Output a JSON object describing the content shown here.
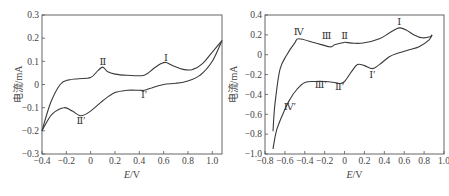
{
  "chart_data": [
    {
      "type": "line",
      "title": "",
      "xlabel": "E/V",
      "ylabel": "电流/mA",
      "xlim": [
        -0.4,
        1.08
      ],
      "ylim": [
        -0.3,
        0.3
      ],
      "xticks": [
        "-0.4",
        "-0.2",
        "0",
        "0.2",
        "0.4",
        "0.6",
        "0.8",
        "1.0"
      ],
      "yticks": [
        "0.3",
        "0.2",
        "0.1",
        "0",
        "-0.1",
        "-0.2",
        "-0.3"
      ],
      "grid": false,
      "legend": null,
      "series": [
        {
          "name": "anodic scan",
          "x": [
            -0.4,
            -0.33,
            -0.25,
            -0.18,
            -0.1,
            0.0,
            0.06,
            0.1,
            0.14,
            0.2,
            0.3,
            0.44,
            0.52,
            0.58,
            0.62,
            0.68,
            0.76,
            0.84,
            0.92,
            1.0,
            1.08
          ],
          "y": [
            -0.2,
            -0.08,
            0.0,
            0.02,
            0.025,
            0.03,
            0.06,
            0.075,
            0.055,
            0.045,
            0.04,
            0.04,
            0.07,
            0.09,
            0.095,
            0.08,
            0.065,
            0.065,
            0.09,
            0.14,
            0.19
          ]
        },
        {
          "name": "cathodic scan",
          "x": [
            -0.4,
            -0.32,
            -0.22,
            -0.15,
            -0.08,
            0.0,
            0.1,
            0.2,
            0.3,
            0.4,
            0.44,
            0.5,
            0.6,
            0.7,
            0.8,
            0.9,
            1.0,
            1.08
          ],
          "y": [
            -0.2,
            -0.13,
            -0.1,
            -0.115,
            -0.135,
            -0.115,
            -0.07,
            -0.035,
            -0.025,
            -0.025,
            -0.025,
            -0.015,
            0.0,
            0.005,
            0.015,
            0.04,
            0.1,
            0.19
          ]
        }
      ],
      "annotations": [
        {
          "text": "Ⅰ",
          "x": 0.62,
          "y": 0.1
        },
        {
          "text": "Ⅱ",
          "x": 0.1,
          "y": 0.085
        },
        {
          "text": "Ⅰ′",
          "x": 0.44,
          "y": -0.06
        },
        {
          "text": "Ⅱ′",
          "x": -0.08,
          "y": -0.17
        }
      ]
    },
    {
      "type": "line",
      "title": "",
      "xlabel": "E/V",
      "ylabel": "电流/mA",
      "xlim": [
        -0.8,
        1.0
      ],
      "ylim": [
        -1.0,
        0.4
      ],
      "xticks": [
        "-0.8",
        "-0.6",
        "-0.4",
        "-0.2",
        "0",
        "0.2",
        "0.4",
        "0.6",
        "0.8",
        "1.0"
      ],
      "yticks": [
        "0.4",
        "0.2",
        "0",
        "-0.2",
        "-0.4",
        "-0.6",
        "-0.8",
        "-1.0"
      ],
      "grid": false,
      "legend": null,
      "series": [
        {
          "name": "anodic scan",
          "x": [
            -0.72,
            -0.7,
            -0.65,
            -0.58,
            -0.5,
            -0.46,
            -0.3,
            -0.15,
            -0.1,
            -0.02,
            0.0,
            0.1,
            0.2,
            0.35,
            0.45,
            0.52,
            0.56,
            0.62,
            0.7,
            0.78,
            0.86,
            0.88
          ],
          "y": [
            -0.77,
            -0.5,
            -0.15,
            0.0,
            0.12,
            0.16,
            0.12,
            0.08,
            0.1,
            0.12,
            0.125,
            0.115,
            0.12,
            0.16,
            0.22,
            0.26,
            0.27,
            0.25,
            0.2,
            0.17,
            0.18,
            0.2
          ]
        },
        {
          "name": "cathodic scan",
          "x": [
            -0.72,
            -0.68,
            -0.6,
            -0.55,
            -0.48,
            -0.4,
            -0.3,
            -0.2,
            -0.1,
            -0.05,
            0.0,
            0.07,
            0.13,
            0.2,
            0.28,
            0.35,
            0.45,
            0.55,
            0.65,
            0.75,
            0.85,
            0.88
          ],
          "y": [
            -0.95,
            -0.75,
            -0.55,
            -0.45,
            -0.35,
            -0.28,
            -0.27,
            -0.27,
            -0.28,
            -0.29,
            -0.27,
            -0.17,
            -0.1,
            -0.11,
            -0.14,
            -0.1,
            -0.02,
            0.02,
            0.05,
            0.08,
            0.15,
            0.2
          ]
        }
      ],
      "annotations": [
        {
          "text": "Ⅰ",
          "x": 0.55,
          "y": 0.3
        },
        {
          "text": "Ⅱ",
          "x": 0.0,
          "y": 0.16
        },
        {
          "text": "Ⅲ",
          "x": -0.18,
          "y": 0.16
        },
        {
          "text": "Ⅳ",
          "x": -0.46,
          "y": 0.2
        },
        {
          "text": "Ⅰ′",
          "x": 0.28,
          "y": -0.23
        },
        {
          "text": "Ⅱ′",
          "x": -0.05,
          "y": -0.36
        },
        {
          "text": "Ⅲ′",
          "x": -0.24,
          "y": -0.34
        },
        {
          "text": "Ⅳ′",
          "x": -0.55,
          "y": -0.56
        }
      ]
    }
  ],
  "colors": {
    "curve": "#3a3a3a",
    "axis": "#555555",
    "text": "#444444"
  }
}
